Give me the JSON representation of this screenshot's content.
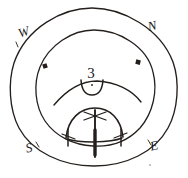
{
  "figure": {
    "kind": "hand-drawn-astronomical-diagram",
    "width": 188,
    "height": 178,
    "background_color": "#ffffff",
    "ink_color": "#241f1c"
  },
  "cardinals": [
    {
      "id": "west",
      "label": "W",
      "x": 25,
      "y": 36,
      "rotation": -18
    },
    {
      "id": "north",
      "label": "N",
      "x": 153,
      "y": 30,
      "rotation": -12
    },
    {
      "id": "south",
      "label": "S",
      "x": 30,
      "y": 152,
      "rotation": -14
    },
    {
      "id": "east",
      "label": "E",
      "x": 155,
      "y": 150,
      "rotation": -12
    }
  ],
  "center_numeral": {
    "label": "3",
    "x": 91,
    "y": 78
  },
  "circles": {
    "outer": {
      "cx": 92,
      "cy": 87,
      "rx": 82,
      "ry": 79
    },
    "inner": {
      "cx": 94,
      "cy": 88,
      "rx": 61,
      "ry": 58
    }
  },
  "markers": [
    {
      "id": "inner-marker-west",
      "x": 45,
      "y": 66,
      "size": 4
    },
    {
      "id": "inner-marker-north",
      "x": 138,
      "y": 62,
      "size": 4
    }
  ],
  "arcs": {
    "cup_arc": "M 81 85 Q 91 96 103 85",
    "horizon_arc": "M 54 104 Q 94 80 140 101",
    "dome_arc": "M 66 137 Q 94 104 123 136"
  },
  "pointer": {
    "vertical_line": {
      "x": 95,
      "y_top": 110,
      "y_bottom": 157
    },
    "top_cross_left": "M 85 113 L 105 119",
    "top_cross_right": "M 85 119 L 105 113",
    "base_tick_left": {
      "x": 68,
      "y_top": 130,
      "y_bottom": 145
    },
    "base_tick_right": {
      "x": 121,
      "y_top": 130,
      "y_bottom": 145
    }
  },
  "speck": {
    "x": 150,
    "y": 165
  }
}
